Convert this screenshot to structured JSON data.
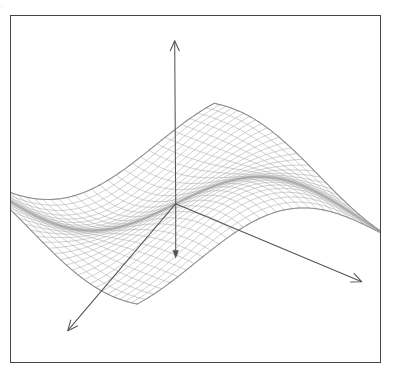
{
  "page": {
    "width": 400,
    "height": 378,
    "background": "#ffffff",
    "scan_bleed_text": "."
  },
  "figure": {
    "kind": "3d-wireframe-surface-plot",
    "frame": {
      "x": 10,
      "y": 15,
      "width": 371,
      "height": 348,
      "border_color": "#454545",
      "border_width": 1.3,
      "fill": "#ffffff"
    },
    "colors": {
      "mesh_line": "#a9a9a9",
      "mesh_line_dark": "#8c8c8c",
      "silhouette": "#909090",
      "axis": "#555555",
      "frame": "#454545",
      "background": "#ffffff"
    }
  },
  "chart_data": {
    "type": "surface",
    "title": "",
    "subtitle": "",
    "xlabel": "",
    "ylabel": "",
    "zlabel": "",
    "legend": [],
    "grid": true,
    "render_style": "wireframe-mesh",
    "mesh": {
      "u_divisions": 34,
      "v_divisions": 34,
      "line_color": "#a9a9a9",
      "line_width": 0.55
    },
    "surface_function": {
      "expression": "z = A1*sin(k1*u)*cos(k2*v) + A2*sin(k3*u + k4*v)",
      "amplitude_1": 0.62,
      "amplitude_2": 0.3,
      "k1": 2.35,
      "k2": 2.05,
      "k3": 1.15,
      "k4": 2.6,
      "domain_u": [
        -1,
        1
      ],
      "domain_v": [
        -1,
        1
      ],
      "zlim": [
        -1,
        1
      ]
    },
    "projection": {
      "type": "oblique-axonometric",
      "origin_px": [
        176,
        204
      ],
      "u_axis_px": [
        1.62,
        0.78
      ],
      "v_axis_px": [
        3.02,
        -0.52
      ],
      "z_axis_px": [
        0,
        -1.0
      ],
      "z_scale": 56,
      "u_scale": 62,
      "v_scale": 46
    },
    "axes": [
      {
        "name": "vertical-axis",
        "from_px": [
          176,
          204
        ],
        "to_px": [
          175,
          41
        ],
        "arrowhead": "open-v",
        "arrow_size": 11,
        "color": "#555555"
      },
      {
        "name": "right-axis",
        "from_px": [
          176,
          204
        ],
        "to_px": [
          362,
          282
        ],
        "arrowhead": "open-v",
        "arrow_size": 11,
        "color": "#555555"
      },
      {
        "name": "front-left-axis",
        "from_px": [
          176,
          204
        ],
        "to_px": [
          68,
          331
        ],
        "arrowhead": "open-v",
        "arrow_size": 11,
        "color": "#555555"
      }
    ],
    "vectors": [
      {
        "name": "descent-vector",
        "from_px": [
          176,
          204
        ],
        "to_px": [
          176,
          259
        ],
        "arrowhead": "solid-triangle",
        "arrow_size": 9,
        "color": "#555555"
      }
    ],
    "annotations": []
  }
}
